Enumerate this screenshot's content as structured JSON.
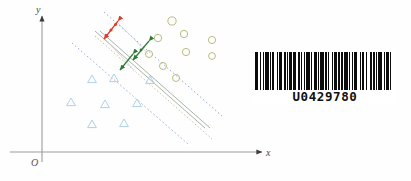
{
  "figure": {
    "axes": {
      "x_label": "x",
      "y_label": "y",
      "origin_label": "O"
    }
  },
  "barcode": {
    "value": "U0429780",
    "bar_pattern": [
      3,
      1,
      1,
      2,
      1,
      1,
      3,
      1,
      1,
      1,
      2,
      2,
      1,
      1,
      3,
      1,
      2,
      1,
      1,
      1,
      2,
      1,
      3,
      2,
      1,
      1,
      1,
      2,
      1,
      1,
      3,
      1,
      1,
      2,
      2,
      1,
      1,
      1,
      3,
      1,
      2,
      1,
      1,
      2,
      1,
      1,
      3,
      1,
      1,
      1,
      2,
      1,
      3,
      1,
      1,
      2,
      1,
      1,
      2,
      3,
      1,
      1,
      1,
      2,
      1,
      3,
      1,
      1,
      2,
      1,
      1,
      1,
      3,
      2,
      1,
      1,
      2,
      1,
      1,
      3
    ]
  },
  "chart_data": {
    "type": "scatter",
    "title": "",
    "xlabel": "x",
    "ylabel": "y",
    "grid": false,
    "legend": null,
    "xlim": [
      0,
      100
    ],
    "ylim": [
      0,
      100
    ],
    "series": [
      {
        "name": "class-circle",
        "marker": "circle",
        "color": "#b6b77a",
        "points": [
          [
            58.5,
            90.0
          ],
          [
            51.0,
            75.5
          ],
          [
            64.5,
            78.0
          ],
          [
            75.5,
            72.5
          ],
          [
            56.5,
            65.0
          ],
          [
            65.0,
            62.0
          ],
          [
            75.5,
            61.5
          ],
          [
            46.5,
            66.0
          ],
          [
            52.0,
            58.0
          ],
          [
            57.5,
            51.5
          ]
        ]
      },
      {
        "name": "class-triangle",
        "marker": "triangle",
        "color": "#a9cfe8",
        "points": [
          [
            23.0,
            48.0
          ],
          [
            33.5,
            49.5
          ],
          [
            15.5,
            37.0
          ],
          [
            25.5,
            33.0
          ],
          [
            22.0,
            23.0
          ],
          [
            32.5,
            23.5
          ],
          [
            41.0,
            36.0
          ],
          [
            48.0,
            48.0
          ]
        ]
      }
    ],
    "decision_boundary": {
      "name": "decision-hyperplane",
      "style": "solid",
      "color": "#9aa79a"
    },
    "margin_lines": {
      "name": "margin-boundaries",
      "style": "dotted",
      "colors": [
        "#8fa8cf",
        "#b1b184"
      ]
    },
    "margin_arrows": [
      {
        "name": "margin-arrow-red",
        "color": "#e03a28"
      },
      {
        "name": "margin-arrow-green",
        "color": "#2f7a33"
      }
    ]
  }
}
